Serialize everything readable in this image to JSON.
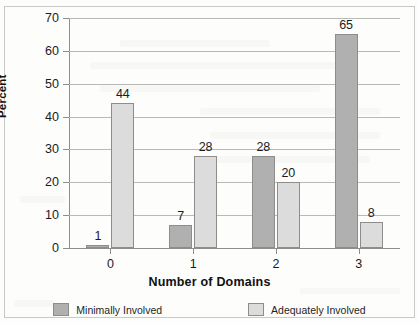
{
  "chart_data": {
    "type": "bar",
    "title": "",
    "xlabel": "Number of Domains",
    "ylabel": "Percent",
    "categories": [
      "0",
      "1",
      "2",
      "3"
    ],
    "series": [
      {
        "name": "Minimally Involved",
        "color": "#b0b0b0",
        "values": [
          1,
          7,
          28,
          65
        ]
      },
      {
        "name": "Adequately Involved",
        "color": "#dcdcdc",
        "values": [
          44,
          28,
          20,
          8
        ]
      }
    ],
    "ylim": [
      0,
      70
    ],
    "ytick_labels": [
      "0",
      "10",
      "20",
      "30",
      "40",
      "50",
      "60",
      "70"
    ],
    "ytick_values": [
      0,
      10,
      20,
      30,
      40,
      50,
      60,
      70
    ],
    "grid": true,
    "legend_position": "bottom",
    "data_labels": true
  },
  "axes": {
    "y_title": "Percent",
    "x_title": "Number of Domains"
  },
  "legend": {
    "entries": [
      {
        "label": "Minimally Involved",
        "swatch": "dark-gray-swatch"
      },
      {
        "label": "Adequately Involved",
        "swatch": "light-gray-swatch"
      }
    ]
  }
}
